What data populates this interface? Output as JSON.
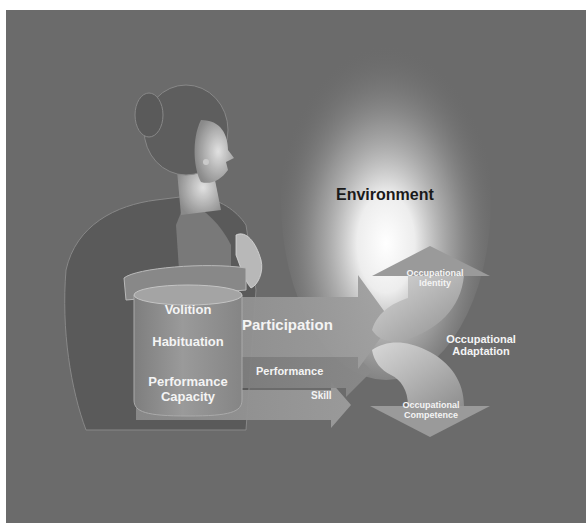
{
  "diagram": {
    "background_color": "#6b6b6b",
    "environment": {
      "label": "Environment",
      "glow_color": "#ffffff"
    },
    "person_components": {
      "items": [
        {
          "label": "Volition"
        },
        {
          "label": "Habituation"
        },
        {
          "label": "Performance Capacity",
          "line1": "Performance",
          "line2": "Capacity"
        }
      ]
    },
    "arrows": [
      {
        "label": "Participation"
      },
      {
        "label": "Performance"
      },
      {
        "label": "Skill"
      }
    ],
    "outcomes": {
      "identity": {
        "line1": "Occupational",
        "line2": "Identity"
      },
      "adaptation": {
        "line1": "Occupational",
        "line2": "Adaptation"
      },
      "competence": {
        "line1": "Occupational",
        "line2": "Competence"
      }
    }
  }
}
